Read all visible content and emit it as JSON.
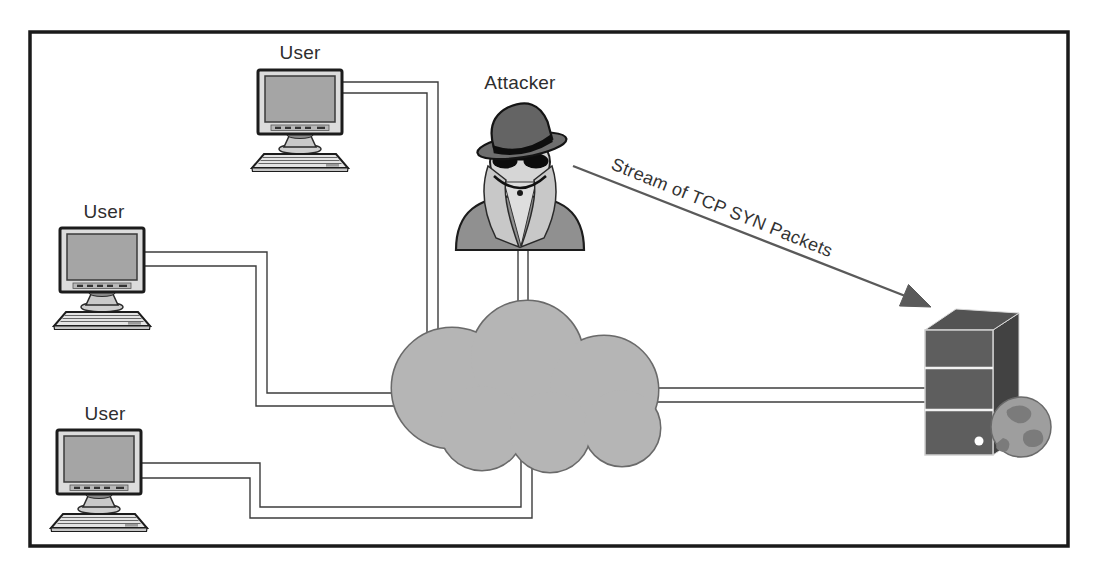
{
  "diagram": {
    "users": [
      {
        "label": "User",
        "icon": "desktop-computer-icon"
      },
      {
        "label": "User",
        "icon": "desktop-computer-icon"
      },
      {
        "label": "User",
        "icon": "desktop-computer-icon"
      }
    ],
    "attacker": {
      "label": "Attacker",
      "icon": "spy-icon"
    },
    "network": {
      "icon": "cloud-icon"
    },
    "server": {
      "icon": "server-icon"
    },
    "globe": {
      "icon": "globe-icon"
    },
    "attack_arrow": {
      "label": "Stream of TCP SYN Packets",
      "icon": "arrow-icon"
    },
    "colors": {
      "frame": "#1a1a1a",
      "background": "#ffffff",
      "cloud_fill": "#b5b5b5",
      "cloud_outline": "#6a6a6a",
      "connection_line": "#3c3c3c",
      "arrow": "#5a5a5a",
      "server_body": "#5e5e5e",
      "label_text": "#2e2e2e"
    }
  }
}
